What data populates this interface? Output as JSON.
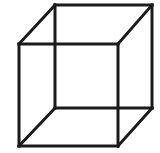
{
  "figure": {
    "title": "Necker cube",
    "type": "line-drawing",
    "canvas": {
      "width": 160,
      "height": 153,
      "background": "#ffffff"
    },
    "style": {
      "stroke_color": "#1a1a1a",
      "stroke_width": 3,
      "fill": "none"
    },
    "vertices": {
      "front_top_left": [
        19,
        44
      ],
      "front_top_right": [
        118,
        44
      ],
      "front_bottom_right": [
        118,
        146
      ],
      "front_bottom_left": [
        19,
        146
      ],
      "back_top_left": [
        55,
        5
      ],
      "back_top_right": [
        152,
        5
      ],
      "back_bottom_right": [
        152,
        108
      ],
      "back_bottom_left": [
        55,
        108
      ]
    },
    "edges": [
      {
        "name": "front-face-top",
        "points": "19,44 118,44"
      },
      {
        "name": "front-face-right",
        "points": "118,44 118,146"
      },
      {
        "name": "front-face-bottom",
        "points": "118,146 19,146"
      },
      {
        "name": "front-face-left",
        "points": "19,146 19,44"
      },
      {
        "name": "back-face-top",
        "points": "55,5 152,5"
      },
      {
        "name": "back-face-right",
        "points": "152,5 152,108"
      },
      {
        "name": "back-face-bottom",
        "points": "152,108 55,108"
      },
      {
        "name": "back-face-left",
        "points": "55,108 55,5"
      },
      {
        "name": "connector-top-left",
        "points": "19,44 55,5"
      },
      {
        "name": "connector-top-right",
        "points": "118,44 152,5"
      },
      {
        "name": "connector-bottom-right",
        "points": "118,146 152,108"
      },
      {
        "name": "connector-bottom-left",
        "points": "19,146 55,108"
      }
    ]
  }
}
